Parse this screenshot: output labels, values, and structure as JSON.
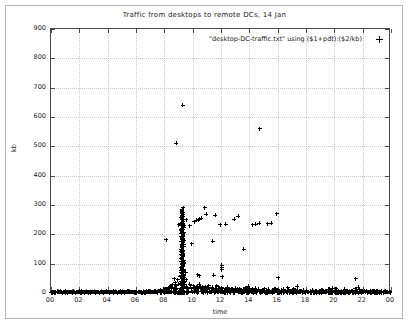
{
  "chart_data": {
    "type": "scatter",
    "title": "Traffic from desktops to remote DCs, 14 Jan",
    "xlabel": "time",
    "ylabel": "kb",
    "legend": "\"desktop-DC-traffic.txt\" using ($1+pdt):($2/kb)",
    "legend_position": "top-right-inside",
    "grid": true,
    "marker": "plus-cross",
    "marker_color": "#000000",
    "xlim": [
      0,
      24
    ],
    "ylim": [
      0,
      900
    ],
    "xticks": [
      0,
      2,
      4,
      6,
      8,
      10,
      12,
      14,
      16,
      18,
      20,
      22,
      24
    ],
    "xtick_labels": [
      "00",
      "02",
      "04",
      "06",
      "08",
      "10",
      "12",
      "14",
      "16",
      "18",
      "20",
      "22",
      "00"
    ],
    "yticks": [
      0,
      100,
      200,
      300,
      400,
      500,
      600,
      700,
      800,
      900
    ],
    "ytick_labels": [
      "0",
      "100",
      "200",
      "300",
      "400",
      "500",
      "600",
      "700",
      "800",
      "900"
    ],
    "x": [
      0.05,
      0.12,
      0.2,
      0.28,
      0.35,
      0.44,
      0.52,
      0.6,
      0.68,
      0.76,
      0.85,
      0.93,
      1.02,
      1.1,
      1.18,
      1.27,
      1.35,
      1.44,
      1.52,
      1.6,
      1.69,
      1.77,
      1.86,
      1.94,
      2.03,
      2.11,
      2.2,
      2.28,
      2.36,
      2.45,
      2.53,
      2.62,
      2.7,
      2.79,
      2.87,
      2.96,
      3.04,
      3.12,
      3.21,
      3.29,
      3.38,
      3.46,
      3.55,
      3.63,
      3.71,
      3.8,
      3.88,
      3.97,
      4.05,
      4.14,
      4.22,
      4.3,
      4.39,
      4.47,
      4.56,
      4.64,
      4.73,
      4.81,
      4.89,
      4.98,
      5.06,
      5.15,
      5.23,
      5.32,
      5.4,
      5.48,
      5.57,
      5.65,
      5.74,
      5.82,
      5.91,
      5.99,
      6.07,
      6.16,
      6.24,
      6.33,
      6.41,
      6.5,
      6.58,
      6.66,
      6.75,
      6.83,
      6.92,
      7.0,
      7.09,
      7.17,
      7.25,
      7.34,
      7.42,
      7.51,
      7.59,
      7.68,
      7.76,
      7.84,
      7.93,
      8.01,
      8.1,
      8.18,
      8.27,
      8.35,
      8.43,
      8.52,
      8.6,
      8.69,
      8.77,
      8.86,
      8.94,
      9.02,
      9.11,
      9.19,
      9.28,
      9.36,
      9.45,
      9.53,
      9.61,
      9.7,
      9.78,
      9.87,
      9.95,
      10.04,
      10.12,
      10.2,
      10.29,
      10.37,
      10.46,
      10.54,
      10.63,
      10.71,
      10.79,
      10.88,
      10.96,
      11.05,
      11.13,
      11.22,
      11.3,
      11.38,
      11.47,
      11.55,
      11.64,
      11.72,
      11.81,
      11.89,
      11.97,
      12.06,
      12.14,
      12.23,
      12.31,
      12.4,
      12.48,
      12.56,
      12.65,
      12.73,
      12.82,
      12.9,
      12.99,
      13.07,
      13.15,
      13.24,
      13.32,
      13.41,
      13.49,
      13.58,
      13.66,
      13.74,
      13.83,
      13.91,
      14.0,
      14.08,
      14.17,
      14.25,
      14.33,
      14.42,
      14.5,
      14.59,
      14.67,
      14.76,
      14.84,
      14.92,
      15.01,
      15.09,
      15.18,
      15.26,
      15.35,
      15.43,
      15.51,
      15.6,
      15.68,
      15.77,
      15.85,
      15.94,
      16.02,
      16.1,
      16.19,
      16.27,
      16.36,
      16.44,
      16.53,
      16.61,
      16.69,
      16.78,
      16.86,
      16.95,
      17.03,
      17.12,
      17.2,
      17.28,
      17.37,
      17.45,
      17.54,
      17.62,
      17.71,
      17.79,
      17.87,
      17.96,
      18.04,
      18.13,
      18.21,
      18.3,
      18.38,
      18.46,
      18.55,
      18.63,
      18.72,
      18.8,
      18.89,
      18.97,
      19.05,
      19.14,
      19.22,
      19.31,
      19.39,
      19.48,
      19.56,
      19.64,
      19.73,
      19.81,
      19.9,
      19.98,
      20.07,
      20.15,
      20.23,
      20.32,
      20.4,
      20.49,
      20.57,
      20.66,
      20.74,
      20.82,
      20.91,
      20.99,
      21.08,
      21.16,
      21.25,
      21.33,
      21.41,
      21.5,
      21.58,
      21.67,
      21.75,
      21.84,
      21.92,
      22.0,
      22.09,
      22.17,
      22.26,
      22.34,
      22.43,
      22.51,
      22.59,
      22.68,
      22.76,
      22.85,
      22.93,
      23.02,
      23.1,
      23.18,
      23.27,
      23.35,
      23.44,
      23.52,
      23.61,
      23.69,
      23.77,
      23.86,
      23.94
    ],
    "y": [
      3,
      2,
      4,
      2,
      3,
      5,
      2,
      3,
      2,
      4,
      3,
      2,
      5,
      3,
      2,
      3,
      4,
      2,
      3,
      2,
      4,
      3,
      2,
      3,
      5,
      2,
      3,
      4,
      2,
      3,
      2,
      4,
      3,
      2,
      3,
      5,
      2,
      3,
      2,
      4,
      3,
      2,
      4,
      3,
      2,
      3,
      2,
      5,
      3,
      2,
      3,
      4,
      2,
      3,
      2,
      3,
      4,
      2,
      3,
      5,
      2,
      3,
      2,
      4,
      3,
      2,
      3,
      2,
      4,
      3,
      5,
      2,
      3,
      4,
      2,
      3,
      2,
      5,
      3,
      2,
      4,
      3,
      6,
      4,
      3,
      5,
      4,
      6,
      3,
      5,
      8,
      6,
      10,
      7,
      12,
      9,
      15,
      11,
      18,
      14,
      22,
      17,
      28,
      20,
      35,
      25,
      45,
      30,
      55,
      40,
      60,
      35,
      28,
      22,
      18,
      15,
      30,
      20,
      14,
      25,
      16,
      12,
      20,
      15,
      30,
      18,
      12,
      22,
      14,
      10,
      18,
      12,
      25,
      15,
      10,
      20,
      12,
      9,
      16,
      11,
      22,
      13,
      9,
      18,
      10,
      8,
      15,
      11,
      20,
      12,
      8,
      14,
      10,
      7,
      16,
      9,
      12,
      8,
      15,
      10,
      7,
      13,
      9,
      18,
      11,
      7,
      14,
      8,
      6,
      12,
      9,
      16,
      10,
      7,
      13,
      8,
      6,
      11,
      9,
      15,
      8,
      6,
      12,
      7,
      5,
      10,
      8,
      14,
      9,
      6,
      11,
      7,
      5,
      9,
      8,
      12,
      7,
      5,
      10,
      6,
      4,
      8,
      7,
      11,
      6,
      4,
      9,
      5,
      4,
      7,
      6,
      10,
      5,
      4,
      8,
      5,
      3,
      6,
      5,
      9,
      4,
      3,
      7,
      4,
      3,
      5,
      4,
      8,
      4,
      3,
      6,
      4,
      3,
      5,
      4,
      7,
      4,
      3,
      5,
      3,
      4,
      6,
      3,
      4,
      5,
      3,
      6,
      4,
      3,
      5,
      4,
      3,
      6,
      4,
      3,
      5,
      4,
      3,
      6,
      4,
      3,
      5,
      4,
      3,
      6,
      4,
      3,
      5,
      4,
      3,
      5,
      4,
      3,
      6,
      5,
      4,
      3,
      5,
      4,
      3,
      6,
      4,
      3,
      5,
      4,
      3,
      6,
      4,
      3,
      5,
      4,
      3,
      6,
      4,
      3,
      5,
      4,
      3,
      6,
      4,
      3,
      5,
      4
    ],
    "outliers": [
      {
        "x": 8.85,
        "y": 510,
        "label": "morning peak A"
      },
      {
        "x": 9.3,
        "y": 640,
        "label": "morning peak B"
      },
      {
        "x": 14.75,
        "y": 560,
        "label": "afternoon peak"
      }
    ],
    "upper_band": [
      {
        "x": 9.0,
        "y": 232
      },
      {
        "x": 9.18,
        "y": 258
      },
      {
        "x": 9.22,
        "y": 262
      },
      {
        "x": 9.55,
        "y": 250
      },
      {
        "x": 9.78,
        "y": 230
      },
      {
        "x": 10.1,
        "y": 243
      },
      {
        "x": 10.3,
        "y": 248
      },
      {
        "x": 10.42,
        "y": 250
      },
      {
        "x": 10.5,
        "y": 252
      },
      {
        "x": 10.6,
        "y": 254
      },
      {
        "x": 10.95,
        "y": 268
      },
      {
        "x": 11.6,
        "y": 265
      },
      {
        "x": 11.95,
        "y": 233
      },
      {
        "x": 12.35,
        "y": 235
      },
      {
        "x": 12.95,
        "y": 252
      },
      {
        "x": 13.2,
        "y": 262
      },
      {
        "x": 14.25,
        "y": 232
      },
      {
        "x": 14.45,
        "y": 235
      },
      {
        "x": 14.7,
        "y": 238
      },
      {
        "x": 15.3,
        "y": 236
      },
      {
        "x": 15.55,
        "y": 238
      },
      {
        "x": 15.95,
        "y": 270
      },
      {
        "x": 10.85,
        "y": 290
      },
      {
        "x": 9.35,
        "y": 290
      }
    ],
    "mid_scatter": [
      {
        "x": 8.15,
        "y": 182
      },
      {
        "x": 9.3,
        "y": 275
      },
      {
        "x": 9.32,
        "y": 238
      },
      {
        "x": 11.4,
        "y": 176
      },
      {
        "x": 9.95,
        "y": 168
      },
      {
        "x": 13.6,
        "y": 150
      },
      {
        "x": 12.05,
        "y": 95
      },
      {
        "x": 12.05,
        "y": 88
      },
      {
        "x": 12.05,
        "y": 80
      },
      {
        "x": 10.35,
        "y": 62
      },
      {
        "x": 10.45,
        "y": 58
      },
      {
        "x": 11.5,
        "y": 60
      },
      {
        "x": 12.1,
        "y": 55
      },
      {
        "x": 16.05,
        "y": 52
      },
      {
        "x": 21.5,
        "y": 48
      },
      {
        "x": 9.5,
        "y": 70
      },
      {
        "x": 9.55,
        "y": 45
      },
      {
        "x": 8.7,
        "y": 48
      }
    ],
    "dense_column": {
      "x_center": 9.28,
      "x_jitter": 0.09,
      "y_min": 0,
      "y_max": 292,
      "count": 190,
      "note": "dense near-vertical burst of samples around 09:15-09:30"
    }
  }
}
